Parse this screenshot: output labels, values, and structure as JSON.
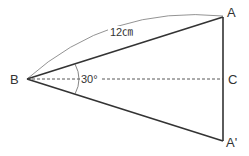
{
  "diagram": {
    "points": {
      "A": {
        "label": "A",
        "x": 223,
        "y": 17
      },
      "B": {
        "label": "B",
        "x": 27,
        "y": 79
      },
      "C": {
        "label": "C",
        "x": 223,
        "y": 79
      },
      "A_prime": {
        "label": "A'",
        "x": 223,
        "y": 141
      }
    },
    "edges": [
      {
        "from": "B",
        "to": "A",
        "style": "solid-thick"
      },
      {
        "from": "B",
        "to": "A_prime",
        "style": "solid-thick"
      },
      {
        "from": "A",
        "to": "A_prime",
        "style": "solid-thick"
      },
      {
        "from": "B",
        "to": "C",
        "style": "dashed"
      }
    ],
    "length_label": "12㎝",
    "angle_label": "30°",
    "colors": {
      "stroke": "#333333",
      "thin": "#666666",
      "text": "#333333"
    }
  }
}
